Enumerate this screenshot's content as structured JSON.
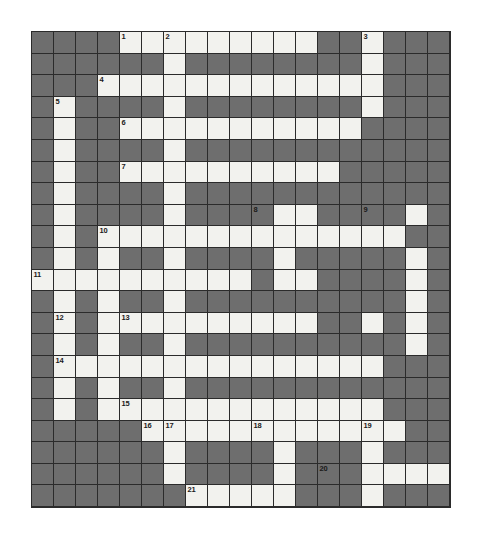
{
  "puzzle": {
    "title": "Crossword Puzzle Grid",
    "type": "crossword",
    "rows": 22,
    "columns": 19,
    "cell_size_px": 22,
    "colors": {
      "block": "#6e6e6e",
      "open": "#f2f2ee",
      "grid_line": "#2b2b2b",
      "number_text": "#1a1a1a",
      "page_background": "#ffffff"
    },
    "clue_numbers": [
      {
        "number": "1",
        "row": 1,
        "col": 5
      },
      {
        "number": "2",
        "row": 1,
        "col": 7
      },
      {
        "number": "3",
        "row": 1,
        "col": 16
      },
      {
        "number": "4",
        "row": 3,
        "col": 4
      },
      {
        "number": "5",
        "row": 4,
        "col": 2
      },
      {
        "number": "6",
        "row": 5,
        "col": 5
      },
      {
        "number": "7",
        "row": 7,
        "col": 5
      },
      {
        "number": "8",
        "row": 9,
        "col": 11
      },
      {
        "number": "9",
        "row": 9,
        "col": 16
      },
      {
        "number": "10",
        "row": 10,
        "col": 4
      },
      {
        "number": "11",
        "row": 12,
        "col": 1
      },
      {
        "number": "12",
        "row": 14,
        "col": 2
      },
      {
        "number": "13",
        "row": 14,
        "col": 5
      },
      {
        "number": "14",
        "row": 16,
        "col": 2
      },
      {
        "number": "15",
        "row": 18,
        "col": 5
      },
      {
        "number": "16",
        "row": 19,
        "col": 6
      },
      {
        "number": "17",
        "row": 19,
        "col": 7
      },
      {
        "number": "18",
        "row": 19,
        "col": 11
      },
      {
        "number": "19",
        "row": 19,
        "col": 16
      },
      {
        "number": "20",
        "row": 21,
        "col": 14
      },
      {
        "number": "21",
        "row": 22,
        "col": 8
      }
    ],
    "grid": [
      "0000111111111001000",
      "0000001000000001000",
      "0001111111111111000",
      "0100001000000001000",
      "0100111111111110000",
      "0100001000000000000",
      "0100111111111100000",
      "0100001000000000000",
      "0100001000011000010",
      "0101111111111111100",
      "0101001000010000010",
      "1111111111011000010",
      "0101001000000000010",
      "0101111111111001010",
      "0101001000000000010",
      "0111111111111111000",
      "0101001000000000000",
      "0101111111111111000",
      "0000011111111111100",
      "0000001000010001000",
      "0000001000010001111",
      "0000000111110001000"
    ]
  }
}
